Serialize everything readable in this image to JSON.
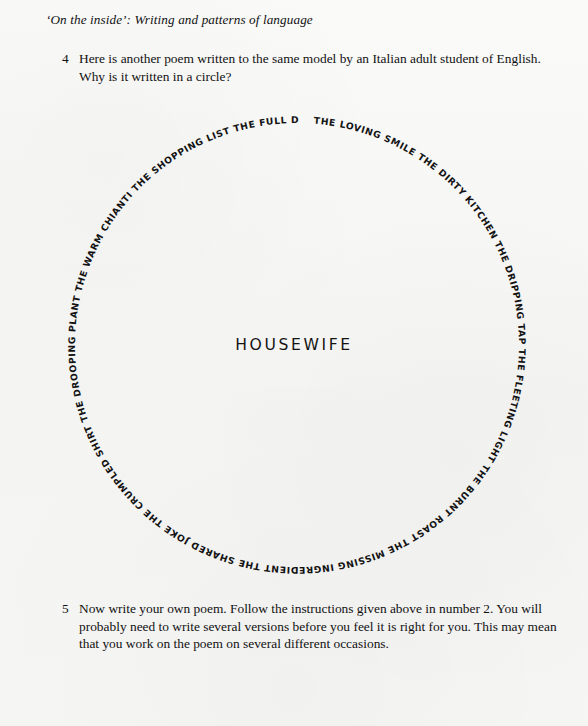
{
  "page": {
    "running_head": "‘On the inside’: Writing and patterns of language",
    "background_color": "#f6f6f5",
    "ink_color": "#111111"
  },
  "exercises": [
    {
      "number": "4",
      "text": "Here is another poem written to the same model by an Italian adult student of English. Why is it written in a circle?"
    },
    {
      "number": "5",
      "text": "Now write your own poem. Follow the instructions given above in number 2. You will probably need to write several versions before you feel it is right for you. This may mean that you work on the poem on several different occasions."
    }
  ],
  "circle_poem": {
    "center_word": "HOUSEWIFE",
    "direction": "clockwise",
    "start_position": "top",
    "lines": [
      "THE LOVING SMILE",
      "THE DIRTY KITCHEN",
      "THE DRIPPING TAP",
      "THE FLEETING LIGHT",
      "THE BURNT ROAST",
      "THE MISSING INGREDIENT",
      "THE SHARED JOKE",
      "THE CRUMPLED SHIRT",
      "THE DROOPING PLANT",
      "THE WARM CHIANTI",
      "THE SHOPPING LIST",
      "THE FULL DUSTBIN"
    ],
    "ring_sequence": "THE LOVING SMILE   THE DIRTY KITCHEN   THE DRIPPING TAP   THE FLEETING LIGHT   THE BURNT ROAST   THE MISSING INGREDIENT   THE SHARED JOKE   THE CRUMPLED SHIRT   THE DROOPING PLANT   THE WARM CHIANTI   THE SHOPPING LIST   THE FULL DUSTBIN"
  }
}
